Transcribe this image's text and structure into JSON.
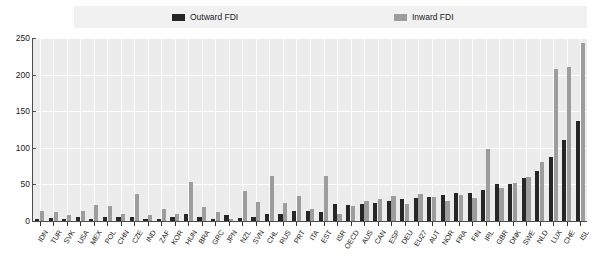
{
  "legend": {
    "position": "top",
    "entries": [
      {
        "label": "Outward FDI",
        "color": "#262626",
        "icon": "legend-swatch-dark"
      },
      {
        "label": "Inward FDI",
        "color": "#9d9d9d",
        "icon": "legend-swatch-light"
      }
    ]
  },
  "chart_data": {
    "type": "bar",
    "title": "",
    "subtitle": "",
    "xlabel": "",
    "ylabel": "",
    "ylim": [
      0,
      250
    ],
    "yticks": [
      0,
      50,
      100,
      150,
      200,
      250
    ],
    "ytick_labels": [
      "0",
      "50",
      "100",
      "150",
      "200",
      "250"
    ],
    "grid": true,
    "legend_position": "top",
    "categories": [
      "IDN",
      "TUR",
      "SVK",
      "USA",
      "MEX",
      "POL",
      "CHN",
      "CZE",
      "IND",
      "ZAF",
      "KOR",
      "HUN",
      "BRA",
      "GRC",
      "JPN",
      "NZL",
      "SVN",
      "CHL",
      "RUS",
      "PRT",
      "ITA",
      "EST",
      "ISR",
      "OECD",
      "AUS",
      "CAN",
      "ESP",
      "DEU",
      "EU27",
      "AUT",
      "NOR",
      "FRA",
      "FIN",
      "IRL",
      "GBR",
      "DNK",
      "SWE",
      "NLD",
      "LUX",
      "CHE",
      "ISL"
    ],
    "series": [
      {
        "name": "Outward FDI",
        "color": "#262626",
        "values": [
          3,
          4,
          3,
          5,
          3,
          5,
          5,
          5,
          3,
          3,
          5,
          9,
          6,
          3,
          8,
          4,
          6,
          9,
          9,
          13,
          14,
          12,
          23,
          22,
          23,
          25,
          27,
          30,
          32,
          33,
          35,
          38,
          38,
          42,
          51,
          50,
          59,
          69,
          87,
          111,
          136
        ]
      },
      {
        "name": "Inward FDI",
        "color": "#9d9d9d",
        "values": [
          14,
          12,
          8,
          14,
          22,
          21,
          10,
          37,
          8,
          16,
          10,
          53,
          19,
          12,
          3,
          41,
          26,
          61,
          24,
          34,
          16,
          62,
          10,
          21,
          27,
          30,
          34,
          23,
          37,
          33,
          27,
          36,
          32,
          98,
          45,
          52,
          60,
          80,
          208,
          210,
          243
        ]
      }
    ]
  }
}
